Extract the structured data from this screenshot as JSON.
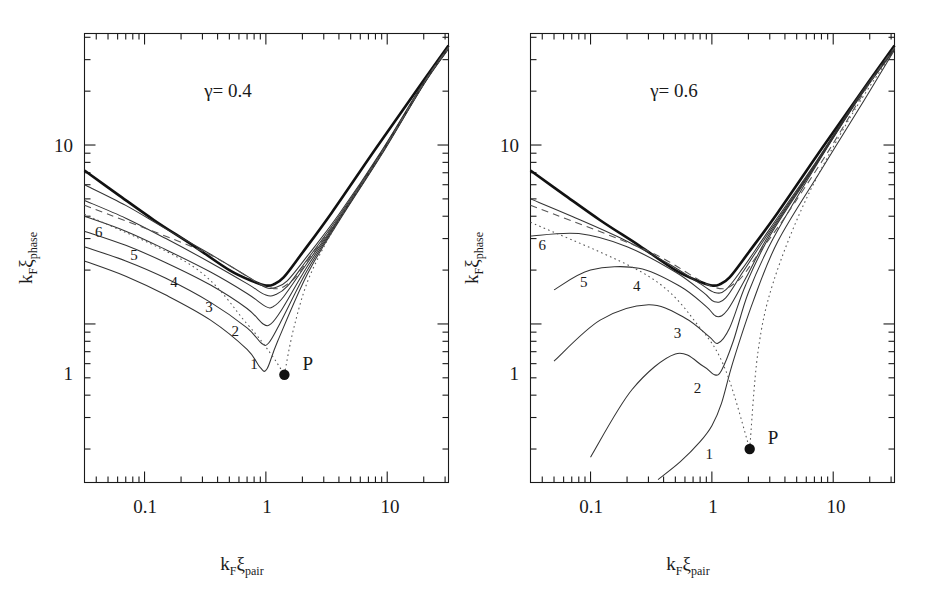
{
  "figure": {
    "background": "#ffffff",
    "ink": "#1a1a1a"
  },
  "axis_labels": {
    "x_main": "k",
    "x_sub1": "F",
    "x_sym": "ξ",
    "x_sub2": "pair",
    "y_main": "k",
    "y_sub1": "F",
    "y_sym": "ξ",
    "y_sub2": "phase"
  },
  "panels": [
    {
      "id": "left",
      "gamma_label": "γ=  0.4",
      "gamma_symbol": "γ",
      "gamma_value": "0.4",
      "point_label": "P",
      "curve_labels": [
        "1",
        "2",
        "3",
        "4",
        "5",
        "6"
      ],
      "x_ticklabels": [
        "0.1",
        "1",
        "10"
      ],
      "y_ticklabels": [
        "1",
        "10"
      ]
    },
    {
      "id": "right",
      "gamma_label": "γ=  0.6",
      "gamma_symbol": "γ",
      "gamma_value": "0.6",
      "point_label": "P",
      "curve_labels": [
        "1",
        "2",
        "3",
        "4",
        "5",
        "6"
      ],
      "x_ticklabels": [
        "0.1",
        "1",
        "10"
      ],
      "y_ticklabels": [
        "1",
        "10"
      ]
    }
  ],
  "chart_data": {
    "type": "line",
    "title": "",
    "xlabel": "k_F xi_pair",
    "ylabel": "k_F xi_phase",
    "xscale": "log",
    "yscale": "log",
    "xlim": [
      0.032,
      32
    ],
    "ylim": [
      0.13,
      42
    ],
    "grid": false,
    "legend": "none",
    "x_ticks_major": [
      0.1,
      1,
      10
    ],
    "y_ticks_major": [
      1,
      10
    ],
    "subplots": [
      {
        "name": "gamma = 0.4",
        "annotation": "γ=  0.4",
        "point_P": {
          "label": "P",
          "x": 1.42,
          "y": 0.52
        },
        "series": [
          {
            "name": "envelope",
            "style": "bold-solid",
            "comment": "thick V-shaped boundary curve",
            "x": [
              0.032,
              0.06,
              0.12,
              0.25,
              0.5,
              0.8,
              1.0,
              1.15,
              1.4,
              2.0,
              3.5,
              8.0,
              20.0,
              32.0
            ],
            "y": [
              7.2,
              5.3,
              3.8,
              2.75,
              2.0,
              1.72,
              1.64,
              1.66,
              1.82,
              2.5,
              4.2,
              9.5,
              23.0,
              36.0
            ]
          },
          {
            "name": "curve-6",
            "style": "solid",
            "x": [
              0.032,
              0.07,
              0.15,
              0.35,
              0.7,
              1.0,
              1.2,
              1.5,
              2.2,
              4.0,
              9.0,
              20.0,
              32.0
            ],
            "y": [
              6.0,
              4.6,
              3.4,
              2.45,
              1.85,
              1.6,
              1.6,
              1.74,
              2.4,
              4.1,
              9.3,
              22.5,
              35.5
            ]
          },
          {
            "name": "curve-5",
            "style": "solid",
            "x": [
              0.032,
              0.07,
              0.15,
              0.35,
              0.7,
              1.0,
              1.2,
              1.5,
              2.2,
              4.0,
              9.0,
              20.0,
              32.0
            ],
            "y": [
              4.9,
              3.9,
              3.0,
              2.2,
              1.68,
              1.45,
              1.46,
              1.62,
              2.3,
              4.0,
              9.2,
              22.3,
              35.2
            ]
          },
          {
            "name": "curve-4",
            "style": "solid",
            "x": [
              0.032,
              0.07,
              0.15,
              0.35,
              0.7,
              1.0,
              1.15,
              1.4,
              2.2,
              4.0,
              9.0,
              20.0,
              32.0
            ],
            "y": [
              4.0,
              3.3,
              2.6,
              1.95,
              1.48,
              1.25,
              1.25,
              1.42,
              2.2,
              3.9,
              9.1,
              22.1,
              35.0
            ]
          },
          {
            "name": "curve-3",
            "style": "solid",
            "x": [
              0.032,
              0.07,
              0.15,
              0.35,
              0.7,
              0.95,
              1.1,
              1.35,
              2.2,
              4.0,
              9.0,
              20.0,
              32.0
            ],
            "y": [
              3.3,
              2.75,
              2.2,
              1.65,
              1.22,
              1.0,
              1.0,
              1.2,
              2.1,
              3.85,
              9.0,
              22.0,
              34.8
            ]
          },
          {
            "name": "curve-2",
            "style": "solid",
            "x": [
              0.032,
              0.07,
              0.15,
              0.35,
              0.7,
              0.92,
              1.05,
              1.3,
              2.2,
              4.0,
              9.0,
              20.0,
              32.0
            ],
            "y": [
              2.7,
              2.25,
              1.8,
              1.32,
              0.95,
              0.78,
              0.78,
              1.0,
              2.0,
              3.8,
              8.9,
              21.9,
              34.6
            ]
          },
          {
            "name": "curve-1",
            "style": "solid",
            "x": [
              0.032,
              0.07,
              0.15,
              0.35,
              0.7,
              0.9,
              1.02,
              1.25,
              2.2,
              4.0,
              9.0,
              20.0,
              32.0
            ],
            "y": [
              2.25,
              1.85,
              1.45,
              1.05,
              0.72,
              0.57,
              0.56,
              0.8,
              1.9,
              3.75,
              8.85,
              21.8,
              34.4
            ]
          },
          {
            "name": "dashed-asymptote",
            "style": "dashed",
            "x": [
              0.032,
              0.3,
              1.0,
              1.6,
              2.4,
              4.0,
              9.0,
              20.0,
              32.0
            ],
            "y": [
              4.6,
              2.55,
              1.62,
              1.72,
              2.45,
              3.95,
              9.1,
              22.2,
              35.1
            ]
          },
          {
            "name": "dotted-locus-to-P",
            "style": "dotted",
            "x": [
              0.032,
              0.25,
              0.7,
              1.1,
              1.42
            ],
            "y": [
              4.1,
              2.1,
              1.0,
              0.68,
              0.52
            ]
          },
          {
            "name": "dotted-branch-right",
            "style": "dotted",
            "x": [
              1.42,
              1.7,
              2.3,
              4.0,
              9.0,
              20.0,
              32.0
            ],
            "y": [
              0.52,
              0.95,
              1.85,
              3.8,
              8.95,
              22.0,
              34.9
            ]
          }
        ]
      },
      {
        "name": "gamma = 0.6",
        "annotation": "γ=  0.6",
        "point_P": {
          "label": "P",
          "x": 2.05,
          "y": 0.2
        },
        "series": [
          {
            "name": "envelope",
            "style": "bold-solid",
            "x": [
              0.032,
              0.06,
              0.12,
              0.25,
              0.5,
              0.8,
              1.0,
              1.15,
              1.4,
              2.0,
              3.5,
              8.0,
              20.0,
              32.0
            ],
            "y": [
              7.2,
              5.3,
              3.8,
              2.75,
              2.0,
              1.72,
              1.64,
              1.66,
              1.82,
              2.5,
              4.2,
              9.5,
              23.0,
              36.0
            ]
          },
          {
            "name": "curve-6",
            "style": "solid",
            "x": [
              0.032,
              0.07,
              0.18,
              0.45,
              0.8,
              1.05,
              1.3,
              1.8,
              3.0,
              7.0,
              16.0,
              32.0
            ],
            "y": [
              5.0,
              4.0,
              3.0,
              2.15,
              1.68,
              1.5,
              1.55,
              2.05,
              3.4,
              7.8,
              18.5,
              35.0
            ]
          },
          {
            "name": "curve-5",
            "style": "solid",
            "x": [
              0.032,
              0.08,
              0.2,
              0.5,
              0.85,
              1.05,
              1.3,
              1.8,
              3.0,
              7.0,
              16.0,
              32.0
            ],
            "y": [
              3.1,
              3.2,
              2.7,
              1.95,
              1.5,
              1.33,
              1.4,
              1.95,
              3.3,
              7.7,
              18.3,
              34.7
            ]
          },
          {
            "name": "curve-4",
            "style": "solid",
            "x": [
              0.05,
              0.1,
              0.25,
              0.55,
              0.9,
              1.1,
              1.35,
              1.9,
              3.0,
              7.0,
              16.0,
              32.0
            ],
            "y": [
              1.55,
              2.0,
              2.05,
              1.62,
              1.25,
              1.1,
              1.2,
              1.8,
              3.2,
              7.6,
              18.1,
              34.5
            ]
          },
          {
            "name": "curve-3",
            "style": "solid",
            "x": [
              0.05,
              0.12,
              0.3,
              0.6,
              0.95,
              1.12,
              1.4,
              1.9,
              3.0,
              7.0,
              16.0,
              32.0
            ],
            "y": [
              0.62,
              1.05,
              1.28,
              1.08,
              0.85,
              0.78,
              0.95,
              1.65,
              3.1,
              7.5,
              18.0,
              34.3
            ]
          },
          {
            "name": "curve-2",
            "style": "solid",
            "x": [
              0.1,
              0.22,
              0.5,
              0.85,
              1.05,
              1.2,
              1.5,
              2.0,
              3.2,
              7.0,
              16.0,
              32.0
            ],
            "y": [
              0.18,
              0.43,
              0.68,
              0.58,
              0.52,
              0.55,
              0.8,
              1.5,
              3.0,
              7.4,
              17.9,
              34.1
            ]
          },
          {
            "name": "curve-1",
            "style": "solid",
            "x": [
              0.36,
              0.55,
              0.8,
              1.0,
              1.2,
              1.5,
              2.2,
              3.5,
              8.0,
              18.0,
              32.0
            ],
            "y": [
              0.135,
              0.17,
              0.22,
              0.27,
              0.36,
              0.62,
              1.35,
              2.9,
              7.3,
              17.8,
              34.0
            ]
          },
          {
            "name": "dashed-asymptote",
            "style": "dashed",
            "x": [
              0.032,
              0.3,
              1.0,
              1.6,
              2.4,
              4.0,
              9.0,
              20.0,
              32.0
            ],
            "y": [
              4.6,
              2.55,
              1.62,
              1.72,
              2.45,
              3.95,
              9.1,
              22.2,
              35.1
            ]
          },
          {
            "name": "dotted-locus-to-P",
            "style": "dotted",
            "x": [
              0.032,
              0.3,
              0.8,
              1.3,
              2.05
            ],
            "y": [
              3.7,
              1.85,
              0.95,
              0.55,
              0.2
            ]
          },
          {
            "name": "dotted-branch-right",
            "style": "dotted",
            "x": [
              2.05,
              2.4,
              3.2,
              6.0,
              14.0,
              32.0
            ],
            "y": [
              0.2,
              0.7,
              1.7,
              5.0,
              14.5,
              34.0
            ]
          }
        ]
      }
    ]
  }
}
